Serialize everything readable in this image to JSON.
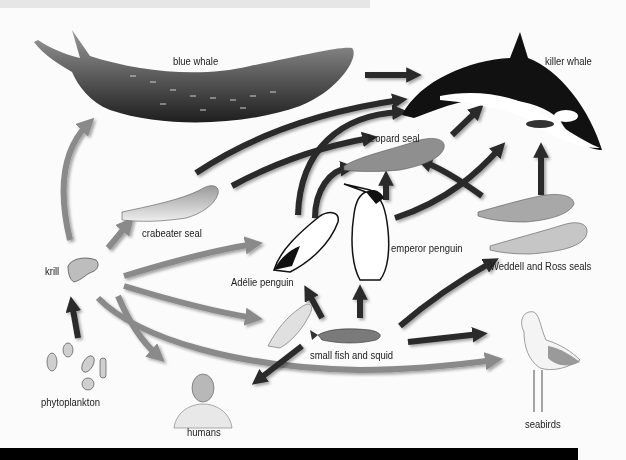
{
  "diagram": {
    "colors": {
      "background": "#fbfbfb",
      "top_band": "#e6e6e6",
      "bottom_band": "#000000",
      "arrow_light": "#8a8a8a",
      "arrow_dark": "#2a2a2a"
    },
    "nodes": {
      "blue_whale": "blue whale",
      "killer_whale": "killer whale",
      "leopard_seal": "leopard seal",
      "crabeater_seal": "crabeater seal",
      "emperor_penguin": "emperor penguin",
      "adelie_penguin": "Adélie penguin",
      "weddell_ross_seals": "Weddell and Ross seals",
      "krill": "krill",
      "small_fish_squid": "small fish and squid",
      "phytoplankton": "phytoplankton",
      "humans": "humans",
      "seabirds": "seabirds"
    },
    "edges": [
      {
        "from": "phytoplankton",
        "to": "krill",
        "shade": "dark"
      },
      {
        "from": "krill",
        "to": "blue whale",
        "shade": "light"
      },
      {
        "from": "krill",
        "to": "crabeater seal",
        "shade": "light"
      },
      {
        "from": "krill",
        "to": "Adélie penguin",
        "shade": "light"
      },
      {
        "from": "krill",
        "to": "small fish and squid",
        "shade": "light"
      },
      {
        "from": "krill",
        "to": "humans",
        "shade": "light"
      },
      {
        "from": "krill",
        "to": "seabirds",
        "shade": "light"
      },
      {
        "from": "blue whale",
        "to": "killer whale",
        "shade": "dark"
      },
      {
        "from": "crabeater seal",
        "to": "killer whale",
        "shade": "dark"
      },
      {
        "from": "crabeater seal",
        "to": "leopard seal",
        "shade": "dark"
      },
      {
        "from": "Adélie penguin",
        "to": "killer whale",
        "shade": "dark"
      },
      {
        "from": "Adélie penguin",
        "to": "leopard seal",
        "shade": "dark"
      },
      {
        "from": "emperor penguin",
        "to": "leopard seal",
        "shade": "dark"
      },
      {
        "from": "emperor penguin",
        "to": "killer whale",
        "shade": "dark"
      },
      {
        "from": "leopard seal",
        "to": "killer whale",
        "shade": "dark"
      },
      {
        "from": "Weddell and Ross seals",
        "to": "killer whale",
        "shade": "dark"
      },
      {
        "from": "Weddell and Ross seals",
        "to": "leopard seal",
        "shade": "dark"
      },
      {
        "from": "small fish and squid",
        "to": "Adélie penguin",
        "shade": "dark"
      },
      {
        "from": "small fish and squid",
        "to": "emperor penguin",
        "shade": "dark"
      },
      {
        "from": "small fish and squid",
        "to": "Weddell and Ross seals",
        "shade": "dark"
      },
      {
        "from": "small fish and squid",
        "to": "seabirds",
        "shade": "dark"
      },
      {
        "from": "small fish and squid",
        "to": "humans",
        "shade": "dark"
      }
    ]
  }
}
